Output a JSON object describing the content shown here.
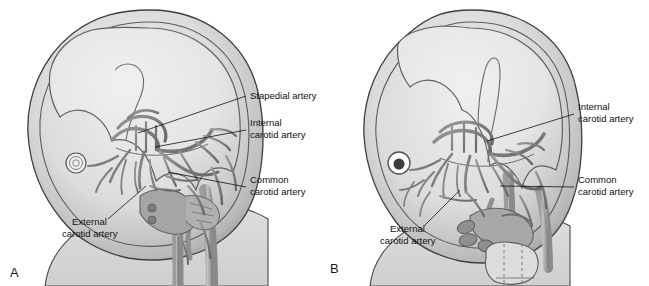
{
  "figure": {
    "background_color": "#ffffff",
    "palette": {
      "head_outline": "#4a4a4a",
      "head_rim": "#9a9a9a",
      "brain_fill": "#e4e4e4",
      "skull_fill": "#c9c9c9",
      "body_fill": "#d6d6d6",
      "vessel_dark": "#6e6e6e",
      "vessel_mid": "#8c8c8c",
      "vessel_light": "#b4b4b4",
      "label_text": "#111111",
      "leader_line": "#111111"
    }
  },
  "panels": [
    {
      "id": "A",
      "letter": "A",
      "letter_pos": {
        "x": 10,
        "y": 277
      },
      "description": "Earlier embryonic stage showing stapedial artery present",
      "eye": {
        "type": "concentric-rings",
        "cx": 76,
        "cy": 163,
        "r": 10
      },
      "annotations": [
        {
          "name": "stapedial-artery",
          "lines": [
            "Stapedial artery"
          ],
          "text_x": 250,
          "text_y": 99,
          "leader": "M246,96 L138,133"
        },
        {
          "name": "internal-carotid-artery",
          "lines": [
            "Internal",
            "carotid artery"
          ],
          "text_x": 250,
          "text_y": 126,
          "leader": "M246,130 L155,147"
        },
        {
          "name": "common-carotid-artery",
          "lines": [
            "Common",
            "carotid artery"
          ],
          "text_x": 250,
          "text_y": 183,
          "leader": "M246,187 L168,172"
        },
        {
          "name": "external-carotid-artery",
          "lines": [
            "External",
            "carotid artery"
          ],
          "text_x": 68,
          "text_y": 225,
          "leader": "M108,219 L146,186"
        }
      ]
    },
    {
      "id": "B",
      "letter": "B",
      "letter_pos": {
        "x": 330,
        "y": 273
      },
      "description": "Later embryonic stage, stapedial artery regressed",
      "eye": {
        "type": "dark-pupil",
        "cx": 399,
        "cy": 163,
        "r": 11
      },
      "annotations": [
        {
          "name": "internal-carotid-artery",
          "lines": [
            "Internal",
            "carotid artery"
          ],
          "text_x": 578,
          "text_y": 110,
          "leader": "M574,114 L487,141"
        },
        {
          "name": "common-carotid-artery",
          "lines": [
            "Common",
            "carotid artery"
          ],
          "text_x": 578,
          "text_y": 183,
          "leader": "M574,187 L500,186"
        },
        {
          "name": "external-carotid-artery",
          "lines": [
            "External",
            "carotid artery"
          ],
          "text_x": 386,
          "text_y": 232,
          "leader": "M424,226 L460,190"
        }
      ]
    }
  ]
}
